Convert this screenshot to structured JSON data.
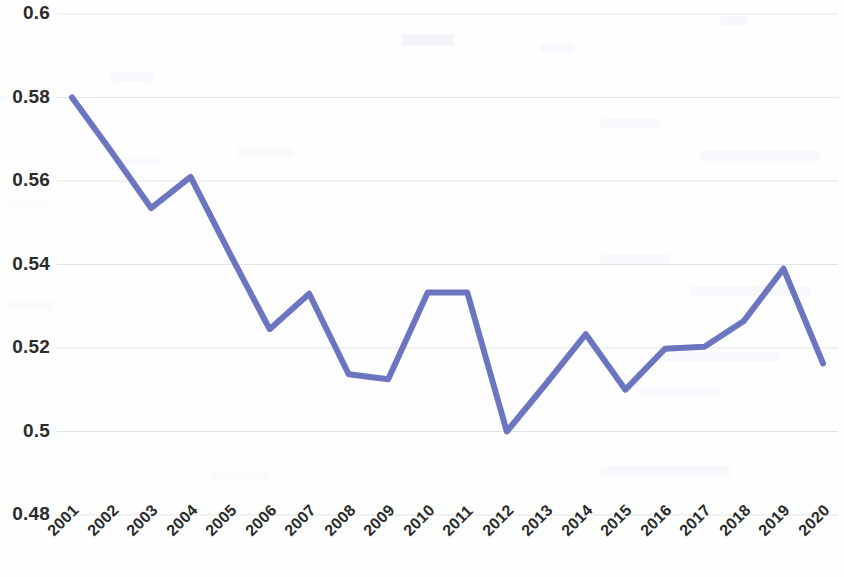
{
  "chart_data": {
    "type": "line",
    "title": "",
    "subtitle": "",
    "xlabel": "",
    "ylabel": "",
    "grid": true,
    "legend": false,
    "legend_position": "none",
    "line_color": "#6c76c0",
    "line_width_px": 6,
    "categories": [
      "2001",
      "2002",
      "2003",
      "2004",
      "2005",
      "2006",
      "2007",
      "2008",
      "2009",
      "2010",
      "2011",
      "2012",
      "2013",
      "2014",
      "2015",
      "2016",
      "2017",
      "2018",
      "2019",
      "2020"
    ],
    "values": [
      0.58,
      0.567,
      0.5535,
      0.561,
      0.5425,
      0.5245,
      0.533,
      0.5137,
      0.5125,
      0.5333,
      0.5333,
      0.5,
      0.5115,
      0.5233,
      0.51,
      0.5198,
      0.5203,
      0.5265,
      0.539,
      0.5163
    ],
    "ylim": [
      0.48,
      0.6
    ],
    "yticks": [
      0.48,
      0.5,
      0.52,
      0.54,
      0.56,
      0.58,
      0.6
    ],
    "ytick_labels": [
      "0.48",
      "0.5",
      "0.52",
      "0.54",
      "0.56",
      "0.58",
      "0.6"
    ],
    "xtick_labels": [
      "2001",
      "2002",
      "2003",
      "2004",
      "2005",
      "2006",
      "2007",
      "2008",
      "2009",
      "2010",
      "2011",
      "2012",
      "2013",
      "2014",
      "2015",
      "2016",
      "2017",
      "2018",
      "2019",
      "2020"
    ],
    "series": [
      {
        "name": "",
        "values": [
          0.58,
          0.567,
          0.5535,
          0.561,
          0.5425,
          0.5245,
          0.533,
          0.5137,
          0.5125,
          0.5333,
          0.5333,
          0.5,
          0.5115,
          0.5233,
          0.51,
          0.5198,
          0.5203,
          0.5265,
          0.539,
          0.5163
        ]
      }
    ],
    "annotations": []
  },
  "colors": {
    "line": "#6c76c0",
    "grid": "#dfe3ea",
    "tick_text": "#2b2b2b",
    "background": "#fefeff"
  }
}
